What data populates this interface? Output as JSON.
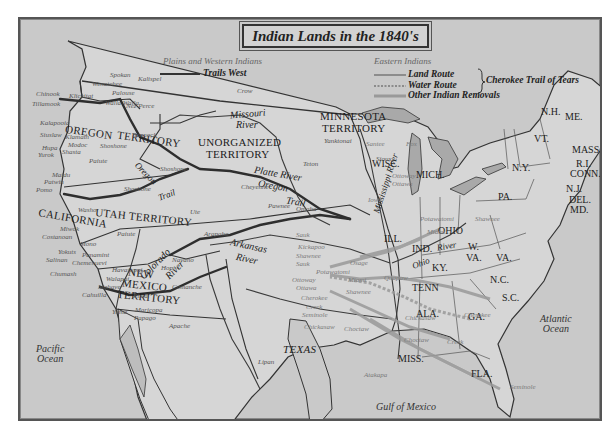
{
  "map": {
    "title": "Indian Lands in the 1840's",
    "legend": {
      "plains_heading": "Plains and Western Indians",
      "trails_west": "Trails West",
      "eastern_heading": "Eastern Indians",
      "land_route": "Land Route",
      "water_route": "Water Route",
      "cherokee": "Cherokee Trail of Tears",
      "other_removals": "Other Indian Removals"
    },
    "territories": {
      "oregon": "OREGON",
      "oregon2": "TERRITORY",
      "unorganized": "UNORGANIZED",
      "unorganized2": "TERRITORY",
      "minnesota": "MINNESOTA",
      "minnesota2": "TERRITORY",
      "california": "CALIFORNIA",
      "utah": "UTAH TERRITORY",
      "newmexico1": "NEW",
      "newmexico2": "MEXICO",
      "newmexico3": "TERRITORY",
      "texas": "TEXAS"
    },
    "states": {
      "wisc": "WISC.",
      "mich": "MICH.",
      "ill": "ILL.",
      "ind": "IND.",
      "ohio": "OHIO",
      "ky": "KY.",
      "tenn": "TENN",
      "wva1": "W.",
      "wva2": "VA.",
      "va": "VA.",
      "pa": "PA.",
      "ny": "N.Y.",
      "nc": "N.C.",
      "sc": "S.C.",
      "ga": "GA.",
      "ala": "ALA.",
      "miss": "MISS.",
      "fla": "FLA.",
      "nh": "N.H.",
      "me": "ME.",
      "vt": "VT.",
      "mass": "MASS.",
      "ri": "R.I.",
      "conn": "CONN.",
      "nj": "N.J.",
      "del": "DEL.",
      "md": "MD."
    },
    "rivers": {
      "missouri1": "Missouri",
      "missouri2": "River",
      "platte": "Platte River",
      "oregon_trail1": "Oregon",
      "oregon_trail2": "Trail",
      "oregon_trail_w1": "Oregon",
      "oregon_trail_w2": "Trail",
      "colorado1": "Colorado",
      "colorado2": "River",
      "arkansas1": "Arkansas",
      "arkansas2": "River",
      "mississippi": "Mississippi River",
      "ohio1": "Ohio",
      "ohio2": "River"
    },
    "oceans": {
      "pacific1": "Pacific",
      "pacific2": "Ocean",
      "atlantic1": "Atlantic",
      "atlantic2": "Ocean",
      "gulf": "Gulf of Mexico"
    },
    "tribes_west": [
      {
        "name": "Spokan",
        "x": 90,
        "y": 53
      },
      {
        "name": "Kalispel",
        "x": 118,
        "y": 57
      },
      {
        "name": "Wenatchee",
        "x": 72,
        "y": 62
      },
      {
        "name": "Palouse",
        "x": 92,
        "y": 71
      },
      {
        "name": "Klickitat",
        "x": 49,
        "y": 74
      },
      {
        "name": "Walla Walla",
        "x": 85,
        "y": 81
      },
      {
        "name": "Nez Perce",
        "x": 106,
        "y": 84
      },
      {
        "name": "Chinook",
        "x": 16,
        "y": 72
      },
      {
        "name": "Tillamook",
        "x": 12,
        "y": 82
      },
      {
        "name": "Kalapooia",
        "x": 20,
        "y": 101
      },
      {
        "name": "Siuslaw",
        "x": 20,
        "y": 113
      },
      {
        "name": "Klamath",
        "x": 45,
        "y": 115
      },
      {
        "name": "Modoc",
        "x": 48,
        "y": 123
      },
      {
        "name": "Hupa",
        "x": 22,
        "y": 126
      },
      {
        "name": "Shasta",
        "x": 42,
        "y": 130
      },
      {
        "name": "Yurok",
        "x": 18,
        "y": 133
      },
      {
        "name": "Shoshone",
        "x": 80,
        "y": 124
      },
      {
        "name": "Bannock",
        "x": 112,
        "y": 113
      },
      {
        "name": "Paiute",
        "x": 69,
        "y": 139
      },
      {
        "name": "Maidu",
        "x": 32,
        "y": 153
      },
      {
        "name": "Patwin",
        "x": 24,
        "y": 160
      },
      {
        "name": "Pomo",
        "x": 16,
        "y": 168
      },
      {
        "name": "Shoshone",
        "x": 104,
        "y": 167
      },
      {
        "name": "Washo",
        "x": 58,
        "y": 188
      },
      {
        "name": "Miwok",
        "x": 40,
        "y": 207
      },
      {
        "name": "Costanoan",
        "x": 22,
        "y": 215
      },
      {
        "name": "Mono",
        "x": 60,
        "y": 222
      },
      {
        "name": "Yokuts",
        "x": 38,
        "y": 230
      },
      {
        "name": "Salinan",
        "x": 26,
        "y": 238
      },
      {
        "name": "Panamint",
        "x": 62,
        "y": 233
      },
      {
        "name": "Chemehuevi",
        "x": 52,
        "y": 241
      },
      {
        "name": "Chumash",
        "x": 30,
        "y": 252
      },
      {
        "name": "Paiute",
        "x": 97,
        "y": 212
      },
      {
        "name": "Ute",
        "x": 170,
        "y": 190
      },
      {
        "name": "Havasupai",
        "x": 92,
        "y": 248
      },
      {
        "name": "Walapai",
        "x": 86,
        "y": 257
      },
      {
        "name": "Mohave",
        "x": 78,
        "y": 265
      },
      {
        "name": "Cahuilla",
        "x": 62,
        "y": 273
      },
      {
        "name": "Pima",
        "x": 113,
        "y": 274
      },
      {
        "name": "Maricopa",
        "x": 115,
        "y": 288
      },
      {
        "name": "Papago",
        "x": 114,
        "y": 296
      },
      {
        "name": "Yuma",
        "x": 92,
        "y": 290
      },
      {
        "name": "Apache",
        "x": 149,
        "y": 304
      },
      {
        "name": "Navaho",
        "x": 152,
        "y": 238
      },
      {
        "name": "Hopi",
        "x": 141,
        "y": 246
      },
      {
        "name": "Comanche",
        "x": 152,
        "y": 265
      },
      {
        "name": "Crow",
        "x": 217,
        "y": 69
      },
      {
        "name": "Cheyenne",
        "x": 221,
        "y": 165
      },
      {
        "name": "Shoshone",
        "x": 140,
        "y": 147
      },
      {
        "name": "Pawnee",
        "x": 248,
        "y": 184
      },
      {
        "name": "Omaha",
        "x": 276,
        "y": 187
      },
      {
        "name": "Yanktonai",
        "x": 304,
        "y": 119
      },
      {
        "name": "Teton",
        "x": 283,
        "y": 142
      },
      {
        "name": "Sioux",
        "x": 356,
        "y": 137
      },
      {
        "name": "Arapaho",
        "x": 184,
        "y": 212
      },
      {
        "name": "Lipan",
        "x": 238,
        "y": 340
      }
    ],
    "tribes_east": [
      {
        "name": "Santee",
        "x": 346,
        "y": 122
      },
      {
        "name": "Fox",
        "x": 386,
        "y": 122
      },
      {
        "name": "Ottoway",
        "x": 372,
        "y": 154
      },
      {
        "name": "Ottawa",
        "x": 372,
        "y": 162
      },
      {
        "name": "Iowa",
        "x": 348,
        "y": 178
      },
      {
        "name": "Potawatomi",
        "x": 400,
        "y": 197
      },
      {
        "name": "Shawnee",
        "x": 455,
        "y": 197
      },
      {
        "name": "Miami",
        "x": 407,
        "y": 210
      },
      {
        "name": "Sauk",
        "x": 276,
        "y": 213
      },
      {
        "name": "Kickapoo",
        "x": 278,
        "y": 225
      },
      {
        "name": "Shawnee",
        "x": 276,
        "y": 234
      },
      {
        "name": "Sauk",
        "x": 276,
        "y": 242
      },
      {
        "name": "Potawatomi",
        "x": 296,
        "y": 250
      },
      {
        "name": "Osage",
        "x": 330,
        "y": 241
      },
      {
        "name": "Ottoway",
        "x": 272,
        "y": 258
      },
      {
        "name": "Ottawa",
        "x": 276,
        "y": 266
      },
      {
        "name": "Miami",
        "x": 328,
        "y": 258
      },
      {
        "name": "Quapaw",
        "x": 364,
        "y": 256
      },
      {
        "name": "Cherokee",
        "x": 281,
        "y": 276
      },
      {
        "name": "Shawnee",
        "x": 326,
        "y": 270
      },
      {
        "name": "Creek",
        "x": 286,
        "y": 285
      },
      {
        "name": "Seminole",
        "x": 282,
        "y": 293
      },
      {
        "name": "Chickasaw",
        "x": 284,
        "y": 305
      },
      {
        "name": "Choctaw",
        "x": 324,
        "y": 307
      },
      {
        "name": "Chickasaw",
        "x": 385,
        "y": 296
      },
      {
        "name": "Cherokee",
        "x": 444,
        "y": 293
      },
      {
        "name": "Choctaw",
        "x": 384,
        "y": 318
      },
      {
        "name": "Creek",
        "x": 427,
        "y": 320
      },
      {
        "name": "Atakapa",
        "x": 344,
        "y": 353
      },
      {
        "name": "Seminole",
        "x": 490,
        "y": 365
      }
    ]
  }
}
